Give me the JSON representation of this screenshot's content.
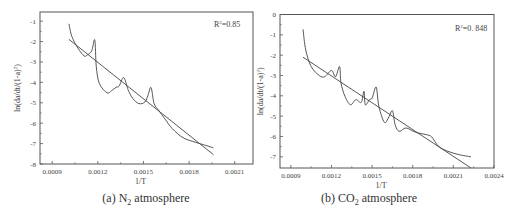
{
  "chart_data": [
    {
      "type": "line",
      "panel": "a",
      "caption_prefix": "(a) N",
      "caption_sub": "2",
      "caption_suffix": " atmosphere",
      "xlabel": "1/T",
      "ylabel": "ln(da/dt/(1-a)^2)",
      "ylabel_main": "ln(da/dt/(1-a)",
      "ylabel_sup": "2",
      "ylabel_end": ")",
      "xlim": [
        0.00082,
        0.00222
      ],
      "ylim": [
        -8,
        -0.55
      ],
      "xticks": [
        0.0009,
        0.0012,
        0.0015,
        0.0018,
        0.0021
      ],
      "xtick_labels": [
        "0.0009",
        "0.0012",
        "0.0015",
        "0.0018",
        "0.0021"
      ],
      "yticks": [
        -1,
        -2,
        -3,
        -4,
        -5,
        -6,
        -7,
        -8
      ],
      "ytick_labels": [
        "-1",
        "-2",
        "-3",
        "-4",
        "-5",
        "-6",
        "-7",
        "-8"
      ],
      "annotation_main": "R",
      "annotation_sup": "2",
      "annotation_value": "=0.85",
      "legend": "none",
      "grid": false,
      "series": [
        {
          "name": "experimental",
          "x": [
            0.00101,
            0.00103,
            0.00107,
            0.00111,
            0.00113,
            0.00116,
            0.00118,
            0.00119,
            0.00121,
            0.00126,
            0.00129,
            0.00132,
            0.00134,
            0.00137,
            0.0014,
            0.00143,
            0.00147,
            0.00151,
            0.00153,
            0.00155,
            0.00157,
            0.0016,
            0.00164,
            0.00169,
            0.00176,
            0.00184,
            0.00191,
            0.00196
          ],
          "y": [
            -1.13,
            -1.76,
            -2.33,
            -2.7,
            -2.66,
            -2.45,
            -1.92,
            -3.23,
            -4.05,
            -4.51,
            -4.41,
            -4.24,
            -4.18,
            -3.76,
            -4.38,
            -4.79,
            -5.04,
            -4.96,
            -4.63,
            -4.25,
            -5.04,
            -5.37,
            -5.78,
            -6.27,
            -6.71,
            -6.93,
            -7.09,
            -7.21
          ]
        },
        {
          "name": "linear fit",
          "x": [
            0.00101,
            0.00196
          ],
          "y": [
            -1.89,
            -7.54
          ]
        }
      ]
    },
    {
      "type": "line",
      "panel": "b",
      "caption_prefix": "(b) CO",
      "caption_sub": "2",
      "caption_suffix": " atmosphere",
      "xlabel": "1/T",
      "ylabel": "ln(da/dt/(1-a)^2)",
      "ylabel_main": "ln(da/dt/(1-a)",
      "ylabel_sup": "2",
      "ylabel_end": ")",
      "xlim": [
        0.00082,
        0.0024
      ],
      "ylim": [
        -7.55,
        0
      ],
      "xticks": [
        0.0009,
        0.0012,
        0.0015,
        0.0018,
        0.0021,
        0.0024
      ],
      "xtick_labels": [
        "0.0009",
        "0.0012",
        "0.0015",
        "0.0018",
        "0.0021",
        "0.0024"
      ],
      "yticks": [
        0,
        -1,
        -2,
        -3,
        -4,
        -5,
        -6,
        -7
      ],
      "ytick_labels": [
        "0",
        "-1",
        "-2",
        "-3",
        "-4",
        "-5",
        "-6",
        "-7"
      ],
      "annotation_main": "R",
      "annotation_sup": "2",
      "annotation_value": "=0. 848",
      "legend": "none",
      "grid": false,
      "series": [
        {
          "name": "experimental",
          "x": [
            0.00099,
            0.00101,
            0.00105,
            0.00111,
            0.00115,
            0.0012,
            0.00123,
            0.00126,
            0.00127,
            0.0013,
            0.00134,
            0.00138,
            0.00142,
            0.00144,
            0.00145,
            0.00148,
            0.0015,
            0.00153,
            0.00155,
            0.00159,
            0.00162,
            0.00165,
            0.00167,
            0.0017,
            0.00175,
            0.00182,
            0.0019,
            0.00194,
            0.00199,
            0.00206,
            0.00214,
            0.00223
          ],
          "y": [
            -0.73,
            -1.74,
            -2.56,
            -3.0,
            -3.06,
            -2.75,
            -3.06,
            -2.56,
            -3.36,
            -4.03,
            -4.44,
            -4.19,
            -4.32,
            -3.78,
            -4.44,
            -4.19,
            -4.11,
            -3.57,
            -4.52,
            -5.3,
            -5.09,
            -4.73,
            -5.42,
            -5.75,
            -5.58,
            -5.79,
            -5.91,
            -6.02,
            -6.48,
            -6.73,
            -6.89,
            -7.0
          ]
        },
        {
          "name": "linear fit",
          "x": [
            0.00099,
            0.00223
          ],
          "y": [
            -2.1,
            -7.55
          ]
        }
      ]
    }
  ]
}
